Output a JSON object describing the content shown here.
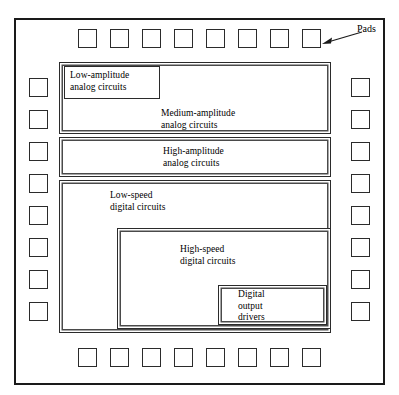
{
  "diagram": {
    "die": {
      "name": "chip-die-outline"
    },
    "annotation": {
      "label": "Pads",
      "arrow_icon": "arrow-left-icon"
    },
    "pad_rows": {
      "top_count": 8,
      "bottom_count": 8,
      "left_count": 8,
      "right_count": 8
    },
    "blocks": [
      {
        "id": "low-amplitude-analog",
        "label": "Low-amplitude\nanalog circuits"
      },
      {
        "id": "medium-amplitude-analog",
        "label": "Medium-amplitude\nanalog circuits"
      },
      {
        "id": "high-amplitude-analog",
        "label": "High-amplitude\nanalog circuits"
      },
      {
        "id": "low-speed-digital",
        "label": "Low-speed\ndigital circuits"
      },
      {
        "id": "high-speed-digital",
        "label": "High-speed\ndigital circuits"
      },
      {
        "id": "digital-output-drivers",
        "label": "Digital\noutput\ndrivers"
      }
    ],
    "colors": {
      "line": "#2b2b2b",
      "frame": "#1a1a1a",
      "background": "#ffffff"
    }
  }
}
